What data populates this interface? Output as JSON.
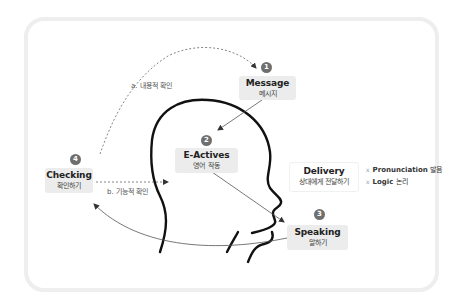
{
  "diagram": {
    "nodes": [
      {
        "id": 1,
        "badge": "1",
        "title": "Message",
        "subtitle": "메시지"
      },
      {
        "id": 2,
        "badge": "2",
        "title": "E-Actives",
        "subtitle": "영어 작동"
      },
      {
        "id": 3,
        "badge": "3",
        "title": "Speaking",
        "subtitle": "말하기"
      },
      {
        "id": 4,
        "badge": "4",
        "title": "Checking",
        "subtitle": "확인하기"
      }
    ],
    "delivery": {
      "title": "Delivery",
      "subtitle": "상대에게 전달하기",
      "items": [
        {
          "mark": "x",
          "en": "Pronunciation",
          "ko": "발음"
        },
        {
          "mark": "x",
          "en": "Logic",
          "ko": "논리"
        }
      ]
    },
    "edge_labels": {
      "a": "a. 내용적 확인",
      "b": "b. 기능적 확인"
    },
    "colors": {
      "box_fill": "#ececec",
      "badge": "#6f6f6f",
      "head_outline": "#111111",
      "arrow": "#555555",
      "frame": "#eeeeee"
    }
  }
}
